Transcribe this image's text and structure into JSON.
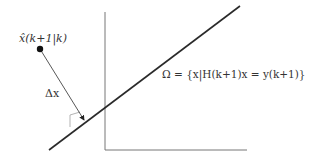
{
  "diagram": {
    "point_label": "x̂(k+1|k)",
    "delta_label": "Δx",
    "set_label": "Ω = {x|H(k+1)x = y(k+1)}",
    "colors": {
      "line": "#2a2a2a",
      "axis": "#777777",
      "marker": "#aaaaaa",
      "point": "#111111"
    }
  }
}
